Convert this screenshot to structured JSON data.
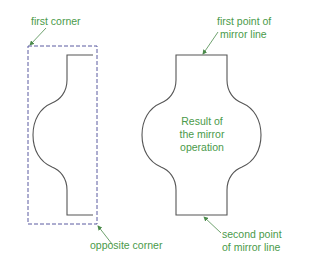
{
  "labels": {
    "first_corner": "first corner",
    "opposite_corner": "opposite corner",
    "first_point_line1": "first point of",
    "first_point_line2": "mirror line",
    "second_point_line1": "second point",
    "second_point_line2": "of mirror line",
    "result_line1": "Result of",
    "result_line2": "the mirror",
    "result_line3": "operation"
  },
  "colors": {
    "label": "#4a9a4a",
    "arrow": "#4a8a4a",
    "selection_box": "#5a5aa0",
    "shape_stroke": "#555555",
    "background": "#ffffff"
  },
  "diagram": {
    "selection_box": {
      "x1": 28,
      "y1": 46,
      "x2": 97,
      "y2": 224,
      "style": "dashed"
    },
    "source_shape": "half profile (left)",
    "result_shape": "full mirrored profile (right)"
  }
}
